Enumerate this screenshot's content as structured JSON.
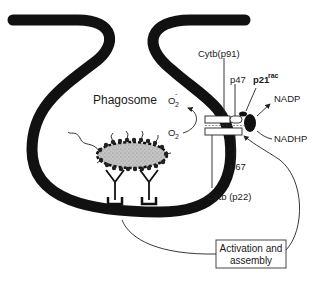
{
  "diagram": {
    "labels": {
      "phagosome": "Phagosome",
      "o2_superoxide": "O",
      "o2_superoxide_sub": "2",
      "o2_superoxide_sup": "-",
      "o2": "O",
      "o2_sub": "2",
      "cytb_p91": "Cytb(p91)",
      "p47": "p47",
      "p21rac": "p21",
      "p21rac_sup": "rac",
      "nadp": "NADP",
      "nadhp": "NADHP",
      "p67": "p67",
      "cytb_p22": "Cytb (p22)",
      "activation_line1": "Activation and",
      "activation_line2": "assembly"
    },
    "colors": {
      "membrane": "#111111",
      "bacterium_fill": "#bdbdbd",
      "line": "#222222",
      "background": "#ffffff"
    }
  }
}
